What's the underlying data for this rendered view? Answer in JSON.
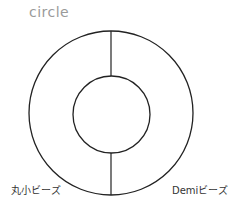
{
  "title": "circle",
  "diagram": {
    "outer_circle": {
      "cx": 111,
      "cy": 113,
      "r": 82
    },
    "inner_circle": {
      "cx": 111,
      "cy": 114,
      "r": 39
    },
    "divider_x": 111,
    "stroke": "#222222"
  },
  "labels": {
    "left": "丸小ビーズ",
    "right": "Demiビーズ"
  }
}
